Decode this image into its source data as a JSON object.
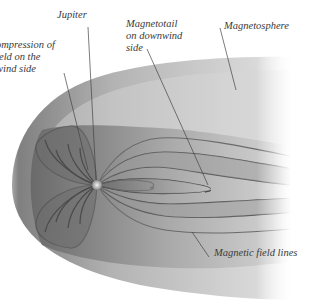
{
  "diagram": {
    "labels": {
      "jupiter": "Jupiter",
      "compression": [
        "ompression of",
        "eld on the",
        "wind side"
      ],
      "magnetotail": [
        "Magnetotail",
        "on downwind",
        "side"
      ],
      "magnetosphere": "Magnetosphere",
      "field_lines": "Magnetic field lines"
    },
    "colors": {
      "background": "#ffffff",
      "shell_dark": "#8a8a8a",
      "shell_light": "#e6e6e6",
      "leader_line": "#444444",
      "label_text": "#3a3a3a"
    }
  }
}
